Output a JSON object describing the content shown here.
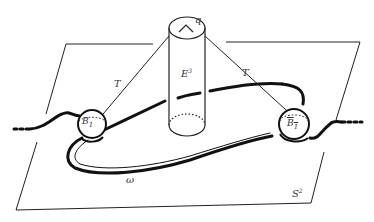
{
  "diagram": {
    "labels": {
      "top_point": "q",
      "cylinder": "E",
      "cylinder_sup": "3",
      "tube_left": "T",
      "tube_right": "T",
      "ball_left": "B",
      "ball_left_sub": "1",
      "ball_right": "B",
      "ball_right_sub": "1",
      "arc": "ω",
      "plane": "S",
      "plane_sup": "2"
    },
    "colors": {
      "ink": "#111111",
      "label": "#333333",
      "background": "#ffffff"
    }
  }
}
